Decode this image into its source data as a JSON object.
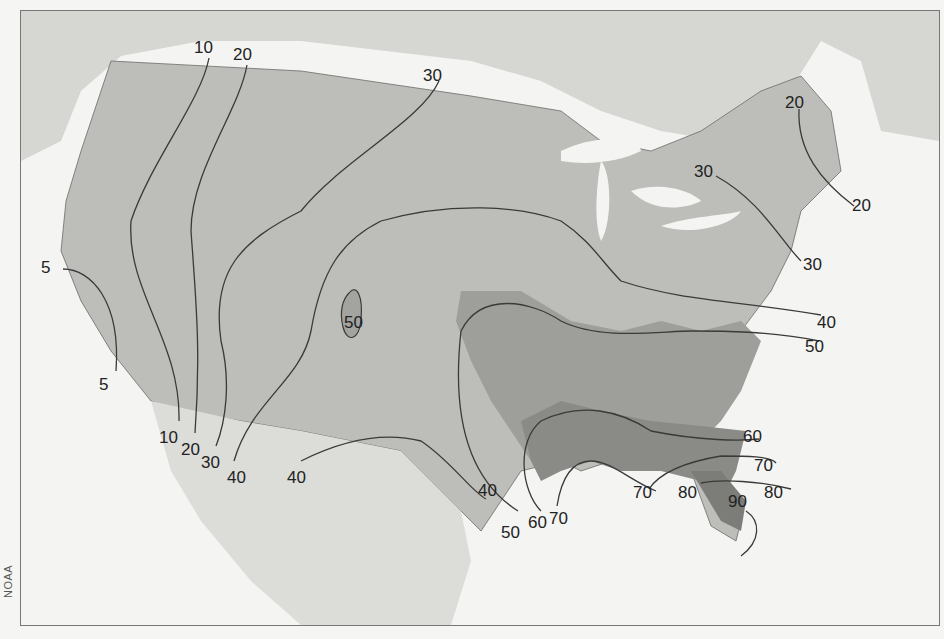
{
  "map": {
    "title": "Average annual number of days with thunderstorms (contiguous United States)",
    "credit": "NOAA",
    "isolines": [
      {
        "value": 5,
        "labels": [
          {
            "text": "5",
            "x": 40,
            "y": 258
          },
          {
            "text": "5",
            "x": 98,
            "y": 375
          }
        ]
      },
      {
        "value": 10,
        "labels": [
          {
            "text": "10",
            "x": 193,
            "y": 38
          },
          {
            "text": "10",
            "x": 158,
            "y": 428
          }
        ]
      },
      {
        "value": 20,
        "labels": [
          {
            "text": "20",
            "x": 232,
            "y": 45
          },
          {
            "text": "20",
            "x": 180,
            "y": 440
          },
          {
            "text": "20",
            "x": 784,
            "y": 93
          },
          {
            "text": "20",
            "x": 851,
            "y": 196
          }
        ]
      },
      {
        "value": 30,
        "labels": [
          {
            "text": "30",
            "x": 422,
            "y": 66
          },
          {
            "text": "30",
            "x": 200,
            "y": 453
          },
          {
            "text": "30",
            "x": 693,
            "y": 162
          },
          {
            "text": "30",
            "x": 802,
            "y": 255
          }
        ]
      },
      {
        "value": 40,
        "labels": [
          {
            "text": "40",
            "x": 226,
            "y": 468
          },
          {
            "text": "40",
            "x": 286,
            "y": 468
          },
          {
            "text": "40",
            "x": 477,
            "y": 481
          },
          {
            "text": "40",
            "x": 816,
            "y": 313
          }
        ]
      },
      {
        "value": 50,
        "labels": [
          {
            "text": "50",
            "x": 343,
            "y": 313
          },
          {
            "text": "50",
            "x": 500,
            "y": 523
          },
          {
            "text": "50",
            "x": 804,
            "y": 337
          }
        ]
      },
      {
        "value": 60,
        "labels": [
          {
            "text": "60",
            "x": 527,
            "y": 513
          },
          {
            "text": "60",
            "x": 742,
            "y": 427
          }
        ]
      },
      {
        "value": 70,
        "labels": [
          {
            "text": "70",
            "x": 548,
            "y": 509
          },
          {
            "text": "70",
            "x": 632,
            "y": 483
          },
          {
            "text": "70",
            "x": 753,
            "y": 456
          }
        ]
      },
      {
        "value": 80,
        "labels": [
          {
            "text": "80",
            "x": 677,
            "y": 483
          },
          {
            "text": "80",
            "x": 763,
            "y": 483
          }
        ]
      },
      {
        "value": 90,
        "labels": [
          {
            "text": "90",
            "x": 727,
            "y": 492
          }
        ]
      }
    ],
    "colors": {
      "ocean": "#f4f4f2",
      "land_outside": "#d9d9d6",
      "band_lt10": "#c9c9c6",
      "band_10_20": "#b4b4b1",
      "band_20_30": "#c4c4c1",
      "band_30_40": "#b7b7b4",
      "band_40_50": "#aaaaa7",
      "band_50_60": "#9b9b98",
      "band_60_70": "#898986",
      "band_70_plus": "#7a7a77",
      "isoline": "#3a3a3a",
      "border": "#6b6b6b"
    }
  }
}
